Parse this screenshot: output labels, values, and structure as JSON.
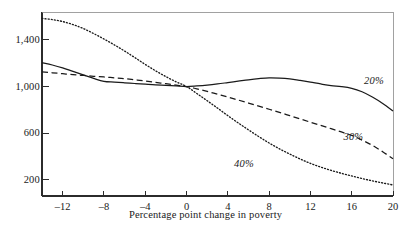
{
  "chart_data": {
    "type": "line",
    "title": "",
    "subtitle": "",
    "xlabel": "Percentage point change in poverty",
    "ylabel": "",
    "xlim": [
      -14,
      20
    ],
    "ylim": [
      60,
      1640
    ],
    "grid": false,
    "legend_position": "inline-right",
    "xticks": [
      -12,
      -8,
      -4,
      0,
      4,
      8,
      12,
      16,
      20
    ],
    "xtick_labels": [
      "–12",
      "–8",
      "–4",
      "0",
      "4",
      "8",
      "12",
      "16",
      "20"
    ],
    "yticks": [
      1400,
      1000,
      600,
      200
    ],
    "ytick_labels": [
      "1,400",
      "1,000",
      "600",
      "200"
    ],
    "annotations": [
      {
        "text": "20%",
        "x": 17.2,
        "y": 1040
      },
      {
        "text": "30%",
        "x": 15.2,
        "y": 560
      },
      {
        "text": "40%",
        "x": 4.6,
        "y": 330
      }
    ],
    "series": [
      {
        "name": "20%",
        "style": "solid",
        "color": "#1a1a1a",
        "x": [
          -14,
          -13,
          -12,
          -11,
          -10,
          -9,
          -8,
          -7,
          -6,
          -5,
          -4,
          -3,
          -2,
          -1,
          0,
          1,
          2,
          3,
          4,
          5,
          6,
          7,
          8,
          9,
          10,
          11,
          12,
          13,
          14,
          15,
          16,
          17,
          18,
          19,
          20
        ],
        "values": [
          1205,
          1185,
          1160,
          1130,
          1100,
          1070,
          1045,
          1038,
          1032,
          1026,
          1020,
          1014,
          1010,
          1005,
          1000,
          1005,
          1012,
          1022,
          1034,
          1046,
          1058,
          1068,
          1075,
          1073,
          1066,
          1053,
          1038,
          1022,
          1008,
          1000,
          985,
          955,
          910,
          855,
          790
        ]
      },
      {
        "name": "30%",
        "style": "dashed",
        "color": "#1a1a1a",
        "x": [
          -14,
          -13,
          -12,
          -11,
          -10,
          -9,
          -8,
          -7,
          -6,
          -5,
          -4,
          -3,
          -2,
          -1,
          0,
          1,
          2,
          3,
          4,
          5,
          6,
          7,
          8,
          9,
          10,
          11,
          12,
          13,
          14,
          15,
          16,
          17,
          18,
          19,
          20
        ],
        "values": [
          1125,
          1118,
          1110,
          1102,
          1095,
          1088,
          1082,
          1075,
          1068,
          1058,
          1048,
          1036,
          1024,
          1012,
          1000,
          980,
          958,
          934,
          910,
          884,
          858,
          832,
          805,
          778,
          750,
          722,
          694,
          666,
          638,
          610,
          580,
          540,
          495,
          440,
          380
        ]
      },
      {
        "name": "40%",
        "style": "dotted",
        "color": "#1a1a1a",
        "x": [
          -14,
          -13,
          -12,
          -11,
          -10,
          -9,
          -8,
          -7,
          -6,
          -5,
          -4,
          -3,
          -2,
          -1,
          0,
          1,
          2,
          3,
          4,
          5,
          6,
          7,
          8,
          9,
          10,
          11,
          12,
          13,
          14,
          15,
          16,
          17,
          18,
          19,
          20
        ],
        "values": [
          1585,
          1575,
          1558,
          1532,
          1498,
          1455,
          1408,
          1358,
          1305,
          1248,
          1190,
          1135,
          1085,
          1040,
          1000,
          940,
          878,
          815,
          750,
          688,
          628,
          570,
          515,
          465,
          420,
          378,
          340,
          308,
          280,
          255,
          232,
          210,
          190,
          172,
          155
        ]
      }
    ]
  },
  "axis": {
    "x_title": "Percentage point change in poverty"
  }
}
